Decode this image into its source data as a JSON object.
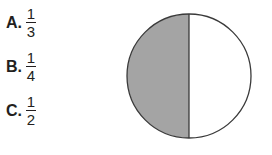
{
  "question": {
    "choices": [
      {
        "letter": "A.",
        "numerator": "1",
        "denominator": "3"
      },
      {
        "letter": "B.",
        "numerator": "1",
        "denominator": "4"
      },
      {
        "letter": "C.",
        "numerator": "1",
        "denominator": "2"
      }
    ]
  },
  "figure": {
    "shape": "circle",
    "parts": 2,
    "shaded_parts": 1,
    "shaded_side": "left",
    "colors": {
      "shade": "#a4a4a4",
      "outline": "#3a3a3a",
      "unshaded": "#ffffff"
    }
  }
}
